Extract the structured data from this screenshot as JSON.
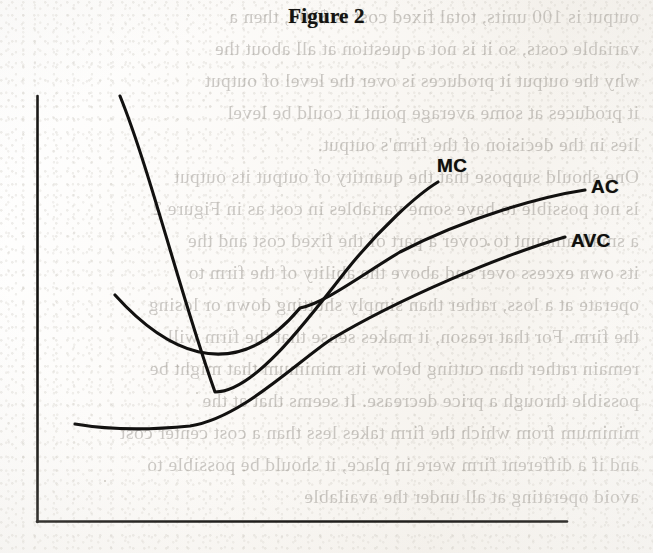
{
  "page": {
    "kind": "scanned-textbook-page",
    "title": "Figure 2",
    "background_color": "#fbfaf8",
    "ink_color": "#121110"
  },
  "figure": {
    "title": "Figure 2",
    "caption": "",
    "axis_color": "#141311",
    "curve_color": "#121110",
    "labels": {
      "mc": "MC",
      "ac": "AC",
      "avc": "AVC"
    }
  },
  "bleed_through_text": {
    "note": "faint mirrored show-through from the reverse side of the page",
    "lines": [
      "output is 100 units, total fixed cost is $200, then a",
      "variable costs, so it is not a question at all about the",
      "why the output it produces is over the level of output",
      "it produces at some average point it could be level",
      "lies in the decision of the firm's output.",
      "One should suppose that the quantity of output its output",
      "is not possible to have some variables in cost as in Figure 2",
      "a small amount to cover a part of the fixed cost and the",
      "its own excess over and above the ability of the firm to",
      "operate at a loss, rather than simply shutting down or losing",
      "the firm. For that reason, it makes sense that the firm will",
      "remain rather than cutting below its minimum that might be",
      "possible through a price decrease. It seems that at the",
      "minimum from which the firm takes less than a cost center cost",
      "and if a different firm were in place, it should be possible to",
      "avoid operating at all under the available"
    ]
  },
  "chart_data": {
    "type": "line",
    "title": "Figure 2",
    "xlabel": "",
    "ylabel": "",
    "axes": {
      "x_axis_shown": true,
      "y_axis_shown": true,
      "ticks": false,
      "grid": false,
      "tick_labels": [],
      "origin_px": [
        37,
        522
      ],
      "x_axis_end_px": [
        567,
        522
      ],
      "y_axis_top_px": [
        37,
        96
      ]
    },
    "legend": {
      "position": "inline-curve-end-labels",
      "entries": [
        "MC",
        "AC",
        "AVC"
      ]
    },
    "annotations": [
      {
        "text": "MC",
        "at_px": [
          437,
          155
        ]
      },
      {
        "text": "AC",
        "at_px": [
          591,
          176
        ]
      },
      {
        "text": "AVC",
        "at_px": [
          571,
          230
        ]
      }
    ],
    "series": [
      {
        "name": "MC",
        "shape": "u-shaped marginal cost",
        "path_px": "M120,96 C150,170 182,300 215,392 C252,392 300,330 345,272 C380,228 418,194 438,182",
        "minimum_px": [
          218,
          393
        ],
        "start_px": [
          120,
          96
        ],
        "end_px": [
          438,
          182
        ]
      },
      {
        "name": "AC",
        "shape": "u-shaped average total cost",
        "path_px": "M115,295 C160,345 230,392 300,308 C325,303 360,276 400,252 C470,216 545,196 585,190",
        "minimum_px": [
          325,
          305
        ],
        "start_px": [
          115,
          295
        ],
        "end_px": [
          585,
          190
        ]
      },
      {
        "name": "AVC",
        "shape": "shallow u-shaped average variable cost",
        "path_px": "M75,424 C110,430 150,430 190,426 C240,418 290,368 330,340 C400,298 500,256 565,237",
        "minimum_px": [
          172,
          429
        ],
        "start_px": [
          75,
          424
        ],
        "end_px": [
          565,
          237
        ]
      }
    ],
    "intersections": [
      {
        "curves": [
          "MC",
          "AVC"
        ],
        "at_px": [
          276,
          370
        ],
        "note": "MC cuts AVC at AVC minimum"
      },
      {
        "curves": [
          "MC",
          "AC"
        ],
        "at_px": [
          340,
          302
        ],
        "note": "MC cuts AC at AC minimum"
      }
    ]
  }
}
